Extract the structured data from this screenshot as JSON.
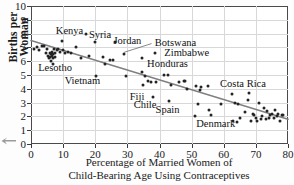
{
  "figure": {
    "partial_top_title": "",
    "x_axis_title_line1": "Percentage of Married Women of",
    "x_axis_title_line2": "Child-Bearing Age Using Contraceptives",
    "y_axis_title": "Births per Woman"
  },
  "chart_data": {
    "type": "scatter",
    "title": "",
    "xlabel": "Percentage of Married Women of Child-Bearing Age Using Contraceptives",
    "ylabel": "Births per Woman",
    "xlim": [
      0,
      80
    ],
    "ylim": [
      0,
      10
    ],
    "xticks": [
      0,
      10,
      20,
      30,
      40,
      50,
      60,
      70,
      80
    ],
    "yticks": [
      0,
      1,
      2,
      3,
      4,
      5,
      6,
      7,
      8,
      9,
      10
    ],
    "grid": true,
    "legend": "none",
    "trendline": {
      "kind": "linear-fit",
      "color": "#808080",
      "x": [
        0,
        80
      ],
      "y": [
        7.5,
        1.8
      ]
    },
    "points": [
      {
        "x": 1.0,
        "y": 6.9
      },
      {
        "x": 1.8,
        "y": 7.0
      },
      {
        "x": 2.5,
        "y": 6.8
      },
      {
        "x": 3.5,
        "y": 7.1
      },
      {
        "x": 4.2,
        "y": 7.1
      },
      {
        "x": 4.6,
        "y": 6.6
      },
      {
        "x": 5.0,
        "y": 6.9
      },
      {
        "x": 5.2,
        "y": 6.4
      },
      {
        "x": 5.5,
        "y": 6.2
      },
      {
        "x": 5.8,
        "y": 6.6
      },
      {
        "x": 6.0,
        "y": 6.3
      },
      {
        "x": 6.2,
        "y": 6.5
      },
      {
        "x": 6.3,
        "y": 6.0
      },
      {
        "x": 6.5,
        "y": 6.4
      },
      {
        "x": 6.6,
        "y": 6.7
      },
      {
        "x": 6.8,
        "y": 6.2
      },
      {
        "x": 7.0,
        "y": 6.5
      },
      {
        "x": 7.0,
        "y": 5.8
      },
      {
        "x": 7.2,
        "y": 6.9
      },
      {
        "x": 7.4,
        "y": 6.3
      },
      {
        "x": 7.6,
        "y": 6.6
      },
      {
        "x": 8.0,
        "y": 6.8
      },
      {
        "x": 8.4,
        "y": 6.9
      },
      {
        "x": 9.0,
        "y": 6.7
      },
      {
        "x": 9.5,
        "y": 7.5
      },
      {
        "x": 10.0,
        "y": 6.8
      },
      {
        "x": 10.5,
        "y": 6.6
      },
      {
        "x": 11.5,
        "y": 6.7
      },
      {
        "x": 12.5,
        "y": 6.6
      },
      {
        "x": 14.0,
        "y": 7.0
      },
      {
        "x": 15.5,
        "y": 6.2
      },
      {
        "x": 17.0,
        "y": 8.0
      },
      {
        "x": 18.0,
        "y": 6.4
      },
      {
        "x": 20.0,
        "y": 7.4
      },
      {
        "x": 20.2,
        "y": 4.9
      },
      {
        "x": 22.5,
        "y": 6.3
      },
      {
        "x": 23.0,
        "y": 5.8
      },
      {
        "x": 24.5,
        "y": 6.1
      },
      {
        "x": 25.5,
        "y": 6.1
      },
      {
        "x": 26.0,
        "y": 7.4
      },
      {
        "x": 29.0,
        "y": 6.5
      },
      {
        "x": 29.5,
        "y": 4.9
      },
      {
        "x": 34.5,
        "y": 6.2
      },
      {
        "x": 34.5,
        "y": 5.2
      },
      {
        "x": 35.0,
        "y": 4.3
      },
      {
        "x": 35.5,
        "y": 4.9
      },
      {
        "x": 36.5,
        "y": 4.6
      },
      {
        "x": 37.5,
        "y": 4.5
      },
      {
        "x": 38.0,
        "y": 3.4
      },
      {
        "x": 38.5,
        "y": 6.6
      },
      {
        "x": 39.0,
        "y": 4.5
      },
      {
        "x": 41.5,
        "y": 5.0
      },
      {
        "x": 42.5,
        "y": 5.0
      },
      {
        "x": 43.0,
        "y": 3.1
      },
      {
        "x": 43.5,
        "y": 4.3
      },
      {
        "x": 46.0,
        "y": 4.5
      },
      {
        "x": 47.5,
        "y": 4.6
      },
      {
        "x": 48.0,
        "y": 4.6
      },
      {
        "x": 48.5,
        "y": 4.0
      },
      {
        "x": 51.0,
        "y": 2.0
      },
      {
        "x": 51.5,
        "y": 4.2
      },
      {
        "x": 52.0,
        "y": 2.9
      },
      {
        "x": 52.5,
        "y": 3.9
      },
      {
        "x": 53.0,
        "y": 4.1
      },
      {
        "x": 55.0,
        "y": 4.2
      },
      {
        "x": 55.5,
        "y": 2.5
      },
      {
        "x": 56.0,
        "y": 2.1
      },
      {
        "x": 59.0,
        "y": 2.9
      },
      {
        "x": 62.5,
        "y": 3.6
      },
      {
        "x": 63.0,
        "y": 1.7
      },
      {
        "x": 63.5,
        "y": 3.0
      },
      {
        "x": 64.0,
        "y": 1.6
      },
      {
        "x": 64.5,
        "y": 2.9
      },
      {
        "x": 65.0,
        "y": 1.9
      },
      {
        "x": 66.5,
        "y": 2.3
      },
      {
        "x": 67.5,
        "y": 3.2
      },
      {
        "x": 68.0,
        "y": 3.7
      },
      {
        "x": 68.5,
        "y": 1.7
      },
      {
        "x": 69.0,
        "y": 2.2
      },
      {
        "x": 69.5,
        "y": 2.1
      },
      {
        "x": 70.0,
        "y": 1.9
      },
      {
        "x": 70.5,
        "y": 1.7
      },
      {
        "x": 71.0,
        "y": 3.0
      },
      {
        "x": 71.5,
        "y": 1.8
      },
      {
        "x": 72.0,
        "y": 2.0
      },
      {
        "x": 72.5,
        "y": 2.6
      },
      {
        "x": 73.0,
        "y": 1.8
      },
      {
        "x": 73.5,
        "y": 2.4
      },
      {
        "x": 74.0,
        "y": 1.9
      },
      {
        "x": 74.5,
        "y": 2.1
      },
      {
        "x": 75.0,
        "y": 2.2
      },
      {
        "x": 75.5,
        "y": 1.9
      },
      {
        "x": 76.0,
        "y": 2.5
      },
      {
        "x": 76.5,
        "y": 2.0
      },
      {
        "x": 77.0,
        "y": 2.2
      },
      {
        "x": 77.5,
        "y": 1.7
      },
      {
        "x": 78.0,
        "y": 2.1
      },
      {
        "x": 78.5,
        "y": 2.1
      }
    ],
    "annotations": [
      {
        "label": "Kenya",
        "x": 12.0,
        "y": 8.2,
        "leader": false
      },
      {
        "label": "Syria",
        "x": 21.5,
        "y": 7.9,
        "leader": false
      },
      {
        "label": "Jordan",
        "x": 30.0,
        "y": 7.5,
        "leader": false
      },
      {
        "label": "Botswana",
        "x": 45.0,
        "y": 7.35,
        "leader": true,
        "leader_to": {
          "x": 29.0,
          "y": 6.5
        }
      },
      {
        "label": "Zimbabwe",
        "x": 48.5,
        "y": 6.6,
        "leader": false
      },
      {
        "label": "Honduras",
        "x": 42.5,
        "y": 5.8,
        "leader": false
      },
      {
        "label": "Lesotho",
        "x": 7.5,
        "y": 5.5,
        "leader": false
      },
      {
        "label": "Vietnam",
        "x": 16.0,
        "y": 4.6,
        "leader": false
      },
      {
        "label": "Costa Rica",
        "x": 66.0,
        "y": 4.35,
        "leader": false
      },
      {
        "label": "Fiji",
        "x": 33.0,
        "y": 3.4,
        "leader": false
      },
      {
        "label": "Chile",
        "x": 35.5,
        "y": 2.85,
        "leader": false
      },
      {
        "label": "Spain",
        "x": 42.5,
        "y": 2.45,
        "leader": false
      },
      {
        "label": "Denmark",
        "x": 57.5,
        "y": 1.45,
        "leader": false
      }
    ]
  }
}
